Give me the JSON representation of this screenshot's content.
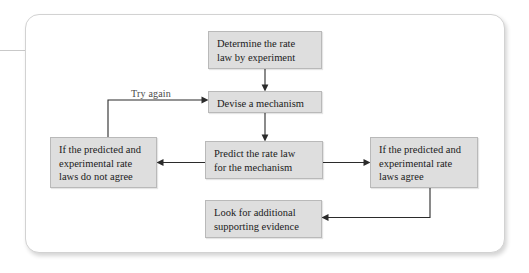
{
  "figure": {
    "type": "flowchart",
    "box_fill_color": "#dedede",
    "box_border_color": "#b9b9b9",
    "connector_color": "#2b2b2b",
    "card_border_color": "#d2d2d2"
  },
  "nodes": {
    "determine": {
      "id": "determine-rate-law",
      "line1": "Determine the rate",
      "line2": "law by experiment"
    },
    "devise": {
      "id": "devise-mechanism",
      "line1": "Devise a mechanism"
    },
    "predict": {
      "id": "predict-rate-law",
      "line1": "Predict the rate law",
      "line2": "for the mechanism"
    },
    "disagree": {
      "id": "rate-laws-do-not-agree",
      "line1": "If the predicted and",
      "line2": "experimental rate",
      "line3": "laws do not agree"
    },
    "agree": {
      "id": "rate-laws-agree",
      "line1": "If the predicted and",
      "line2": "experimental rate",
      "line3": "laws agree"
    },
    "look": {
      "id": "look-for-evidence",
      "line1": "Look for additional",
      "line2": "supporting evidence"
    }
  },
  "labels": {
    "try_again": "Try again"
  },
  "edges": [
    {
      "from": "determine",
      "to": "devise",
      "label": ""
    },
    {
      "from": "devise",
      "to": "predict",
      "label": ""
    },
    {
      "from": "predict",
      "to": "disagree",
      "label": ""
    },
    {
      "from": "predict",
      "to": "agree",
      "label": ""
    },
    {
      "from": "disagree",
      "to": "devise",
      "label": "Try again"
    },
    {
      "from": "agree",
      "to": "look",
      "label": ""
    }
  ]
}
